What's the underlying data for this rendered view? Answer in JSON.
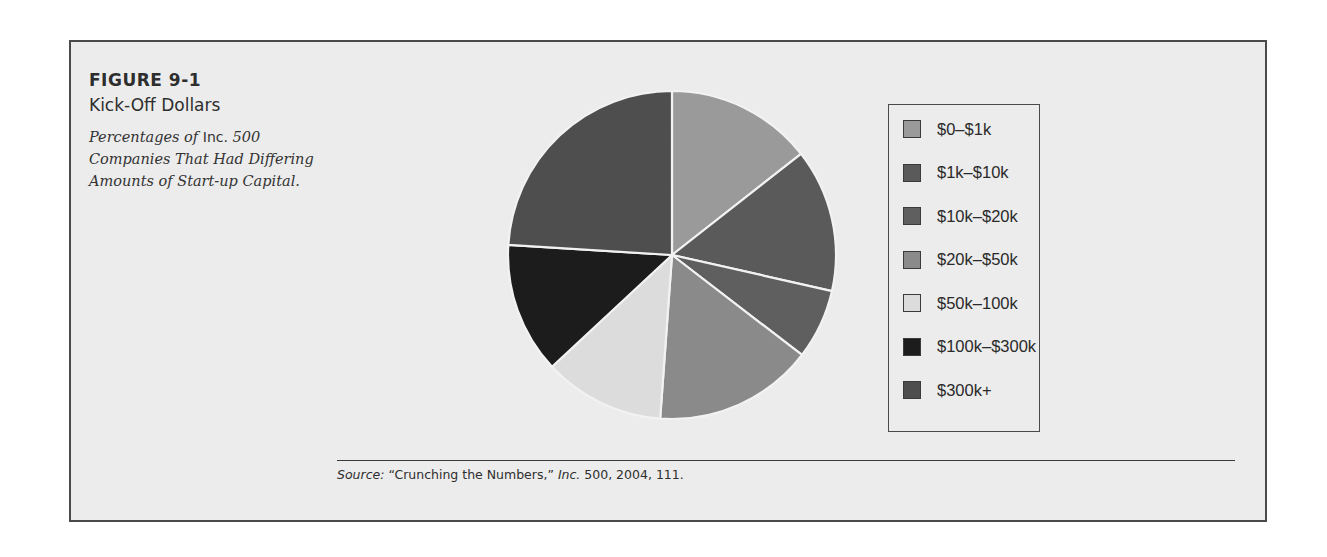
{
  "figure": {
    "number": "FIGURE 9-1",
    "title": "Kick-Off Dollars",
    "subtitle_parts": {
      "a": "Percentages of ",
      "b": "Inc.",
      "c": " 500 Companies That Had Differing Amounts of Start-up Capital."
    }
  },
  "source": {
    "label": "Source:",
    "text": " “Crunching the Numbers,” ",
    "publication": "Inc.",
    "rest": " 500, 2004, 111."
  },
  "colors": {
    "frame_bg": "#ececec",
    "frame_border": "#4a4a4a",
    "slice_gap": "#f2f2f2"
  },
  "chart_data": {
    "type": "pie",
    "title": "Kick-Off Dollars",
    "subtitle": "Percentages of Inc. 500 Companies That Had Differing Amounts of Start-up Capital.",
    "start_angle_deg": 0,
    "direction": "clockwise",
    "legend_position": "right",
    "categories": [
      "$0–$1k",
      "$1k–$10k",
      "$10k–$20k",
      "$20k–$50k",
      "$50k–100k",
      "$100k–$300k",
      "$300k+"
    ],
    "values": [
      14.4,
      14.1,
      6.9,
      15.7,
      11.9,
      12.9,
      24.0
    ],
    "units": "percent (estimated from slice angles)",
    "colors": [
      "#9a9a9a",
      "#5a5a5a",
      "#5f5f5f",
      "#8a8a8a",
      "#dcdcdc",
      "#1c1c1c",
      "#4e4e4e"
    ]
  }
}
